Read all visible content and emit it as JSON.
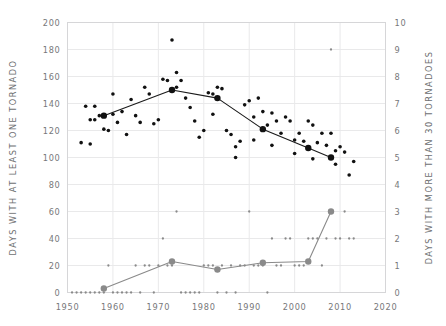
{
  "chart_data": {
    "type": "scatter",
    "title": "",
    "xlabel": "",
    "ylabel": "DAYS WITH AT LEAST ONE TORNADO",
    "y2label": "DAYS WITH MORE THAN 30 TORNADOES",
    "grid": true,
    "legend": "none",
    "xlim": [
      1950,
      2020
    ],
    "ylim": [
      0,
      200
    ],
    "y2lim": [
      0,
      10
    ],
    "xticks": [
      1950,
      1960,
      1970,
      1980,
      1990,
      2000,
      2010,
      2020
    ],
    "xticklabels": [
      "1950",
      "1960",
      "1970",
      "1980",
      "1990",
      "2000",
      "2010",
      "2020"
    ],
    "yticks": [
      0,
      20,
      40,
      60,
      80,
      100,
      120,
      140,
      160,
      180,
      200
    ],
    "yticklabels": [
      "0",
      "20",
      "40",
      "60",
      "80",
      "100",
      "120",
      "140",
      "160",
      "180",
      "200"
    ],
    "y2ticks": [
      0,
      1,
      2,
      3,
      4,
      5,
      6,
      7,
      8,
      9,
      10
    ],
    "y2ticklabels": [
      "0",
      "1",
      "2",
      "3",
      "4",
      "5",
      "6",
      "7",
      "8",
      "9",
      "10"
    ],
    "colors": {
      "series1_marker": "#111111",
      "series1_line": "#1a1a1a",
      "series2_marker": "#8a8a8a",
      "series2_line": "#8a8a8a",
      "grid": "#e9e9ea",
      "frame": "#d6d6d8",
      "text": "#77787a"
    },
    "series": [
      {
        "name": "Days with at least one tornado (annual)",
        "axis": "left",
        "kind": "scatter",
        "marker": "small-dot",
        "points": [
          [
            1954,
            138
          ],
          [
            1955,
            128
          ],
          [
            1956,
            128
          ],
          [
            1957,
            131
          ],
          [
            1958,
            131
          ],
          [
            1958,
            121
          ],
          [
            1959,
            120
          ],
          [
            1953,
            111
          ],
          [
            1955,
            110
          ],
          [
            1956,
            138
          ],
          [
            1960,
            147
          ],
          [
            1960,
            132
          ],
          [
            1961,
            126
          ],
          [
            1962,
            134
          ],
          [
            1963,
            117
          ],
          [
            1964,
            143
          ],
          [
            1965,
            131
          ],
          [
            1966,
            126
          ],
          [
            1967,
            152
          ],
          [
            1968,
            147
          ],
          [
            1969,
            125
          ],
          [
            1970,
            128
          ],
          [
            1971,
            158
          ],
          [
            1972,
            157
          ],
          [
            1973,
            187
          ],
          [
            1974,
            163
          ],
          [
            1974,
            152
          ],
          [
            1975,
            157
          ],
          [
            1976,
            144
          ],
          [
            1977,
            137
          ],
          [
            1978,
            127
          ],
          [
            1979,
            115
          ],
          [
            1980,
            120
          ],
          [
            1981,
            148
          ],
          [
            1982,
            147
          ],
          [
            1982,
            132
          ],
          [
            1983,
            152
          ],
          [
            1984,
            151
          ],
          [
            1985,
            120
          ],
          [
            1986,
            117
          ],
          [
            1987,
            108
          ],
          [
            1988,
            112
          ],
          [
            1989,
            139
          ],
          [
            1990,
            142
          ],
          [
            1991,
            130
          ],
          [
            1992,
            144
          ],
          [
            1993,
            134
          ],
          [
            1994,
            124
          ],
          [
            1995,
            133
          ],
          [
            1996,
            127
          ],
          [
            1997,
            118
          ],
          [
            1998,
            130
          ],
          [
            1999,
            127
          ],
          [
            2000,
            113
          ],
          [
            2001,
            118
          ],
          [
            2002,
            112
          ],
          [
            2003,
            127
          ],
          [
            2004,
            124
          ],
          [
            2005,
            111
          ],
          [
            2006,
            118
          ],
          [
            2007,
            109
          ],
          [
            2008,
            118
          ],
          [
            2009,
            105
          ],
          [
            2010,
            108
          ],
          [
            2011,
            104
          ],
          [
            2012,
            87
          ],
          [
            2013,
            97
          ],
          [
            1987,
            100
          ],
          [
            1991,
            113
          ],
          [
            1995,
            109
          ],
          [
            2000,
            103
          ],
          [
            2004,
            99
          ],
          [
            2009,
            95
          ]
        ]
      },
      {
        "name": "Days with at least one tornado (decadal mean)",
        "axis": "left",
        "kind": "line",
        "marker": "large-dot",
        "points": [
          [
            1958,
            131
          ],
          [
            1973,
            150
          ],
          [
            1983,
            144
          ],
          [
            1993,
            121
          ],
          [
            2003,
            107
          ],
          [
            2008,
            100
          ]
        ]
      },
      {
        "name": "Days with more than 30 tornadoes (annual)",
        "axis": "right",
        "kind": "scatter",
        "marker": "small-dot",
        "points": [
          [
            1951,
            0
          ],
          [
            1952,
            0
          ],
          [
            1953,
            0
          ],
          [
            1954,
            0
          ],
          [
            1955,
            0
          ],
          [
            1956,
            0
          ],
          [
            1957,
            0
          ],
          [
            1958,
            0
          ],
          [
            1959,
            1
          ],
          [
            1960,
            0
          ],
          [
            1961,
            0
          ],
          [
            1962,
            0
          ],
          [
            1963,
            0
          ],
          [
            1964,
            0
          ],
          [
            1965,
            1
          ],
          [
            1966,
            0
          ],
          [
            1967,
            1
          ],
          [
            1968,
            1
          ],
          [
            1969,
            0
          ],
          [
            1970,
            1
          ],
          [
            1971,
            2
          ],
          [
            1972,
            1
          ],
          [
            1973,
            1
          ],
          [
            1974,
            3
          ],
          [
            1975,
            0
          ],
          [
            1976,
            0
          ],
          [
            1977,
            0
          ],
          [
            1978,
            0
          ],
          [
            1979,
            0
          ],
          [
            1980,
            1
          ],
          [
            1981,
            1
          ],
          [
            1982,
            1
          ],
          [
            1983,
            0
          ],
          [
            1984,
            1
          ],
          [
            1985,
            0
          ],
          [
            1986,
            1
          ],
          [
            1987,
            0
          ],
          [
            1988,
            1
          ],
          [
            1989,
            1
          ],
          [
            1990,
            3
          ],
          [
            1991,
            1
          ],
          [
            1992,
            1
          ],
          [
            1993,
            1
          ],
          [
            1994,
            0
          ],
          [
            1995,
            2
          ],
          [
            1996,
            1
          ],
          [
            1997,
            1
          ],
          [
            1998,
            2
          ],
          [
            1999,
            2
          ],
          [
            2000,
            1
          ],
          [
            2001,
            1
          ],
          [
            2002,
            1
          ],
          [
            2003,
            2
          ],
          [
            2004,
            2
          ],
          [
            2005,
            2
          ],
          [
            2006,
            1
          ],
          [
            2007,
            2
          ],
          [
            2008,
            9
          ],
          [
            2009,
            2
          ],
          [
            2010,
            2
          ],
          [
            2011,
            3
          ],
          [
            2012,
            2
          ],
          [
            2013,
            2
          ]
        ]
      },
      {
        "name": "Days with more than 30 tornadoes (decadal mean)",
        "axis": "right",
        "kind": "line",
        "marker": "large-dot",
        "points": [
          [
            1958,
            0.15
          ],
          [
            1973,
            1.15
          ],
          [
            1983,
            0.85
          ],
          [
            1993,
            1.1
          ],
          [
            2003,
            1.15
          ],
          [
            2008,
            3.0
          ]
        ]
      }
    ]
  }
}
